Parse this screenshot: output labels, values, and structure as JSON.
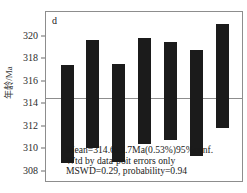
{
  "chart_data": {
    "type": "bar",
    "title": "",
    "panel_label": "d",
    "xlabel": "",
    "ylabel": "年龄/Ma",
    "ylim": [
      307.0,
      322.2
    ],
    "yticks": [
      308,
      310,
      312,
      314,
      316,
      318,
      320
    ],
    "ytick_labels": [
      "308",
      "310",
      "312",
      "314",
      "316",
      "318",
      "320"
    ],
    "grid": false,
    "legend": "none",
    "orientation": "vertical",
    "bar_style": "floating-range-bars",
    "categories": [
      "1",
      "2",
      "3",
      "4",
      "5",
      "6",
      "7"
    ],
    "bars": [
      {
        "label": "1",
        "low": 308.8,
        "high": 317.5,
        "center": 313.15,
        "error": 4.35
      },
      {
        "label": "2",
        "low": 310.1,
        "high": 319.7,
        "center": 314.9,
        "error": 4.8
      },
      {
        "label": "3",
        "low": 308.9,
        "high": 317.6,
        "center": 313.25,
        "error": 4.35
      },
      {
        "label": "4",
        "low": 310.5,
        "high": 319.9,
        "center": 315.2,
        "error": 4.7
      },
      {
        "label": "5",
        "low": 310.8,
        "high": 319.5,
        "center": 315.15,
        "error": 4.35
      },
      {
        "label": "6",
        "low": 309.4,
        "high": 318.8,
        "center": 314.1,
        "error": 4.7
      },
      {
        "label": "7",
        "low": 311.9,
        "high": 321.1,
        "center": 316.5,
        "error": 4.6
      }
    ],
    "mean_line": {
      "value": 314.6,
      "color": "#8d8d8d"
    },
    "annotations": [
      "Mean=314.6±1.7Ma(0.53%)95%conf.",
      "Wtd by data-poit errors only",
      "MSWD=0.29, probability=0.94"
    ],
    "colors": {
      "bar": "#1b1b1b",
      "frame": "#8d8d8d",
      "mean_line": "#8d8d8d",
      "text": "#1a1a1a",
      "background": "#ffffff"
    },
    "statistics": {
      "mean": 314.6,
      "uncertainty": 1.7,
      "uncertainty_unit": "Ma",
      "uncertainty_percent": "0.53%",
      "confidence": "95%conf.",
      "weighting": "Wtd by data-poit errors only",
      "mswd": 0.29,
      "probability": 0.94
    }
  }
}
